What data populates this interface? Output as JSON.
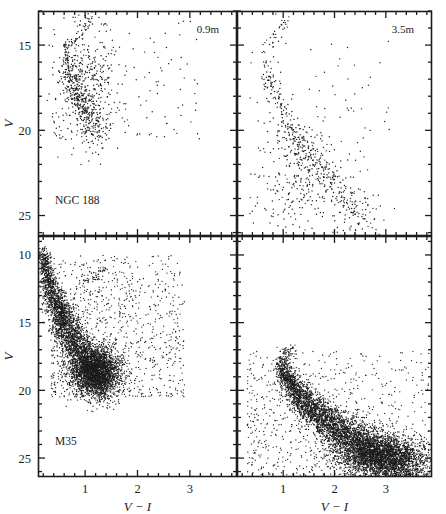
{
  "figure": {
    "title": "",
    "width": 446,
    "height": 514,
    "background": "#ffffff",
    "ink_color": "#1c1c1c"
  },
  "axis_names": {
    "y": "V",
    "x": "V − I"
  },
  "chart_data": {
    "type": "scatter",
    "title": "",
    "xlabel": "V − I",
    "ylabel": "V",
    "grid": false,
    "legend": "none",
    "panels": [
      {
        "id": "ngc188-0.9m",
        "row": 0,
        "col": 0,
        "cluster_label": "NGC 188",
        "telescope_label": "0.9m",
        "xlim": [
          0.1,
          3.9
        ],
        "ylim": [
          26.2,
          13.0
        ],
        "y_inverted": true,
        "xticks": [
          1,
          2,
          3
        ],
        "xtick_labels": [
          "",
          "",
          ""
        ],
        "xtick_minor_step": 0.2,
        "yticks": [
          15,
          20,
          25
        ],
        "ytick_labels": [
          "15",
          "20",
          "25"
        ],
        "ytick_minor_step": 1,
        "n_points": 900,
        "point_size_px": 1.4,
        "features": {
          "main_sequence": {
            "turnoff_color": 0.62,
            "turnoff_mag": 15.0,
            "faint_color": 1.25,
            "faint_mag": 20.2,
            "scatter_color": 0.07,
            "scatter_mag": 0.35,
            "weight": 0.38
          },
          "giant_branch": {
            "base_color": 0.7,
            "base_mag": 15.1,
            "tip_color": 1.1,
            "tip_mag": 13.3,
            "weight": 0.05
          },
          "field_blob": {
            "color_range": [
              0.35,
              1.7
            ],
            "mag_range": [
              13.4,
              20.6
            ],
            "weight": 0.42
          },
          "field_sparse": {
            "color_range": [
              0.4,
              3.2
            ],
            "mag_range": [
              13.3,
              20.8
            ],
            "weight": 0.15
          }
        }
      },
      {
        "id": "ngc188-3.5m",
        "row": 0,
        "col": 1,
        "cluster_label": "",
        "telescope_label": "3.5m",
        "xlim": [
          0.1,
          3.9
        ],
        "ylim": [
          26.2,
          13.0
        ],
        "y_inverted": true,
        "xticks": [
          1,
          2,
          3
        ],
        "xtick_labels": [
          "",
          "",
          ""
        ],
        "xtick_minor_step": 0.2,
        "yticks": [
          15,
          20,
          25
        ],
        "ytick_labels": [
          "",
          "",
          ""
        ],
        "ytick_minor_step": 1,
        "n_points": 780,
        "point_size_px": 1.4,
        "features": {
          "main_sequence": {
            "turnoff_color": 0.63,
            "turnoff_mag": 15.1,
            "faint_color": 2.7,
            "faint_mag": 25.4,
            "scatter_color": 0.09,
            "scatter_mag": 0.4,
            "weight": 0.5
          },
          "giant_branch": {
            "base_color": 0.72,
            "base_mag": 15.0,
            "tip_color": 1.05,
            "tip_mag": 13.6,
            "weight": 0.04
          },
          "field_blob": {
            "color_range": [
              0.45,
              2.3
            ],
            "mag_range": [
              18.5,
              25.9
            ],
            "weight": 0.33
          },
          "field_sparse": {
            "color_range": [
              0.35,
              3.5
            ],
            "mag_range": [
              14.5,
              26.0
            ],
            "weight": 0.13
          }
        }
      },
      {
        "id": "m35-0.9m",
        "row": 1,
        "col": 0,
        "cluster_label": "M35",
        "telescope_label": "",
        "xlim": [
          0.1,
          3.9
        ],
        "ylim": [
          26.4,
          8.6
        ],
        "y_inverted": true,
        "xticks": [
          1,
          2,
          3
        ],
        "xtick_labels": [
          "1",
          "2",
          "3"
        ],
        "xtick_minor_step": 0.2,
        "yticks": [
          10,
          15,
          20,
          25
        ],
        "ytick_labels": [
          "10",
          "15",
          "20",
          "25"
        ],
        "ytick_minor_step": 1,
        "n_points": 6200,
        "point_size_px": 1.3,
        "features": {
          "main_sequence": {
            "turnoff_color": 0.2,
            "turnoff_mag": 9.4,
            "faint_color": 1.35,
            "faint_mag": 19.6,
            "scatter_color": 0.1,
            "scatter_mag": 0.5,
            "weight": 0.5
          },
          "giant_branch": {
            "base_color": 0.9,
            "base_mag": 12.0,
            "tip_color": 1.4,
            "tip_mag": 11.3,
            "weight": 0.01
          },
          "field_blob": {
            "color_range": [
              0.7,
              1.7
            ],
            "mag_range": [
              16.5,
              20.3
            ],
            "weight": 0.33
          },
          "field_sparse": {
            "color_range": [
              0.35,
              2.9
            ],
            "mag_range": [
              10.0,
              20.5
            ],
            "weight": 0.16
          }
        }
      },
      {
        "id": "m35-3.5m",
        "row": 1,
        "col": 1,
        "cluster_label": "",
        "telescope_label": "",
        "xlim": [
          0.1,
          3.9
        ],
        "ylim": [
          26.4,
          8.6
        ],
        "y_inverted": true,
        "xticks": [
          1,
          2,
          3
        ],
        "xtick_labels": [
          "1",
          "2",
          "3"
        ],
        "xtick_minor_step": 0.2,
        "yticks": [
          10,
          15,
          20,
          25
        ],
        "ytick_labels": [
          "",
          "",
          "",
          ""
        ],
        "ytick_minor_step": 1,
        "n_points": 7000,
        "point_size_px": 1.3,
        "features": {
          "main_sequence": {
            "turnoff_color": 0.95,
            "turnoff_mag": 17.6,
            "faint_color": 3.6,
            "faint_mag": 26.2,
            "scatter_color": 0.13,
            "scatter_mag": 0.6,
            "weight": 0.62
          },
          "giant_branch": {
            "base_color": 1.0,
            "base_mag": 17.5,
            "tip_color": 1.2,
            "tip_mag": 17.0,
            "weight": 0.01
          },
          "field_blob": {
            "color_range": [
              1.9,
              3.8
            ],
            "mag_range": [
              23.0,
              26.3
            ],
            "weight": 0.27
          },
          "field_sparse": {
            "color_range": [
              0.3,
              3.85
            ],
            "mag_range": [
              17.0,
              26.3
            ],
            "weight": 0.1
          }
        }
      }
    ]
  }
}
